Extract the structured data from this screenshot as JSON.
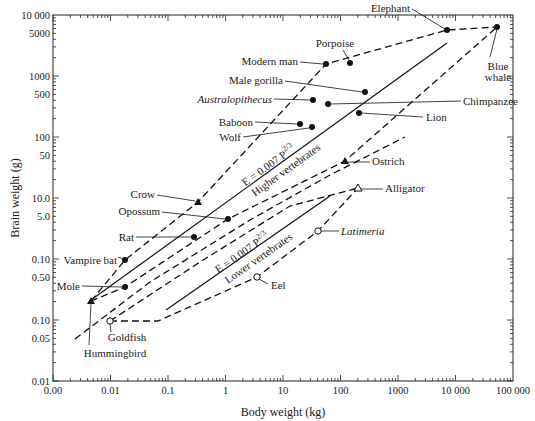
{
  "chart_data": {
    "type": "scatter",
    "title": "",
    "xlabel": "Body weight (kg)",
    "ylabel": "Brain weight (g)",
    "xscale": "log",
    "yscale": "log",
    "xlim": [
      0.001,
      100000
    ],
    "ylim": [
      0.01,
      10000
    ],
    "grid": false,
    "legend": null,
    "x_ticks": [
      {
        "value": 0.001,
        "label": "0.00"
      },
      {
        "value": 0.01,
        "label": "0.01"
      },
      {
        "value": 0.1,
        "label": "0.1"
      },
      {
        "value": 1,
        "label": "1"
      },
      {
        "value": 10,
        "label": "10"
      },
      {
        "value": 100,
        "label": "100"
      },
      {
        "value": 1000,
        "label": "1000"
      },
      {
        "value": 10000,
        "label": "10 000"
      },
      {
        "value": 100000,
        "label": "100 000"
      }
    ],
    "y_ticks": [
      {
        "value": 10000,
        "label": "10 000"
      },
      {
        "value": 5000,
        "label": "5000"
      },
      {
        "value": 1000,
        "label": "1000"
      },
      {
        "value": 500,
        "label": "500"
      },
      {
        "value": 100,
        "label": "100"
      },
      {
        "value": 50,
        "label": "50"
      },
      {
        "value": 10,
        "label": "10.0"
      },
      {
        "value": 5,
        "label": "5.0"
      },
      {
        "value": 1,
        "label": "0.10"
      },
      {
        "value": 0.5,
        "label": "0.50"
      },
      {
        "value": 0.1,
        "label": "0.10"
      },
      {
        "value": 0.05,
        "label": "0.05"
      },
      {
        "value": 0.01,
        "label": "0.01"
      }
    ],
    "points": [
      {
        "name": "Elephant",
        "x": 7000,
        "y": 5600,
        "marker": "filled-circle",
        "group": "mammal"
      },
      {
        "name": "Blue whale",
        "x": 52000,
        "y": 6300,
        "marker": "filled-circle",
        "group": "mammal"
      },
      {
        "name": "Porpoise",
        "x": 150,
        "y": 1650,
        "marker": "filled-circle",
        "group": "mammal"
      },
      {
        "name": "Modern man",
        "x": 56,
        "y": 1600,
        "marker": "filled-circle",
        "group": "mammal"
      },
      {
        "name": "Male gorilla",
        "x": 270,
        "y": 550,
        "marker": "filled-circle",
        "group": "mammal"
      },
      {
        "name": "Australopithecus",
        "x": 33,
        "y": 400,
        "marker": "filled-circle",
        "group": "mammal",
        "italic": true
      },
      {
        "name": "Chimpanzee",
        "x": 60,
        "y": 350,
        "marker": "filled-circle",
        "group": "mammal"
      },
      {
        "name": "Lion",
        "x": 210,
        "y": 245,
        "marker": "filled-circle",
        "group": "mammal"
      },
      {
        "name": "Baboon",
        "x": 20,
        "y": 160,
        "marker": "filled-circle",
        "group": "mammal"
      },
      {
        "name": "Wolf",
        "x": 32,
        "y": 145,
        "marker": "filled-circle",
        "group": "mammal"
      },
      {
        "name": "Ostrich",
        "x": 120,
        "y": 40,
        "marker": "filled-triangle",
        "group": "bird"
      },
      {
        "name": "Crow",
        "x": 0.33,
        "y": 8.5,
        "marker": "filled-triangle",
        "group": "bird"
      },
      {
        "name": "Opossum",
        "x": 1.1,
        "y": 4.6,
        "marker": "filled-circle",
        "group": "mammal"
      },
      {
        "name": "Rat",
        "x": 0.28,
        "y": 2.3,
        "marker": "filled-circle",
        "group": "mammal"
      },
      {
        "name": "Vampire bat",
        "x": 0.018,
        "y": 0.96,
        "marker": "filled-circle",
        "group": "mammal"
      },
      {
        "name": "Mole",
        "x": 0.018,
        "y": 0.35,
        "marker": "filled-circle",
        "group": "mammal"
      },
      {
        "name": "Hummingbird",
        "x": 0.0046,
        "y": 0.2,
        "marker": "filled-triangle",
        "group": "bird"
      },
      {
        "name": "Alligator",
        "x": 200,
        "y": 14,
        "marker": "open-triangle",
        "group": "reptile"
      },
      {
        "name": "Latimeria",
        "x": 40,
        "y": 2.9,
        "marker": "open-circle",
        "group": "fish",
        "italic": true
      },
      {
        "name": "Eel",
        "x": 3.5,
        "y": 0.5,
        "marker": "open-circle",
        "group": "fish"
      },
      {
        "name": "Goldfish",
        "x": 0.01,
        "y": 0.1,
        "marker": "open-circle",
        "group": "fish"
      }
    ],
    "fit_lines": [
      {
        "name": "Higher vertebrates",
        "equation": "E = 0.007 P^(2/3)",
        "label_eq": "E 0.007 P",
        "label_exp": "2/3",
        "label_group": "Higher vertebrates",
        "x_range": [
          0.005,
          6000
        ]
      },
      {
        "name": "Lower vertebrates",
        "equation": "E = 0.007 P^(2/3)",
        "label_eq": "E 0.007 P",
        "label_exp": "2/3",
        "label_group": "Lower vertebrates",
        "x_range": [
          0.1,
          120
        ]
      }
    ],
    "annotations": {
      "higher_eq": "E = 0.007 P",
      "higher_exp": "2/3",
      "higher_label": "Higher vertebrates",
      "lower_eq": "E = 0.007 P",
      "lower_exp": "2/3",
      "lower_label": "Lower vertebrates"
    },
    "polygons": [
      {
        "name": "mammals-birds-outer-envelope",
        "style": "dashed"
      },
      {
        "name": "mammals-birds-inner-envelope",
        "style": "dashed"
      },
      {
        "name": "fish-reptiles-envelope",
        "style": "dashed"
      }
    ]
  },
  "labels": {
    "Elephant": "Elephant",
    "Blue whale line 1": "Blue",
    "Blue whale line 2": "whale",
    "Porpoise": "Porpoise",
    "Modern man": "Modern man",
    "Male gorilla": "Male gorilla",
    "Australopithecus": "Australopithecus",
    "Chimpanzee": "Chimpanzee",
    "Lion": "Lion",
    "Baboon": "Baboon",
    "Wolf": "Wolf",
    "Ostrich": "Ostrich",
    "Crow": "Crow",
    "Opossum": "Opossum",
    "Rat": "Rat",
    "Vampire bat": "Vampire bat",
    "Mole": "Mole",
    "Hummingbird": "Hummingbird",
    "Alligator": "Alligator",
    "Latimeria": "Latimeria",
    "Eel": "Eel",
    "Goldfish": "Goldfish"
  }
}
